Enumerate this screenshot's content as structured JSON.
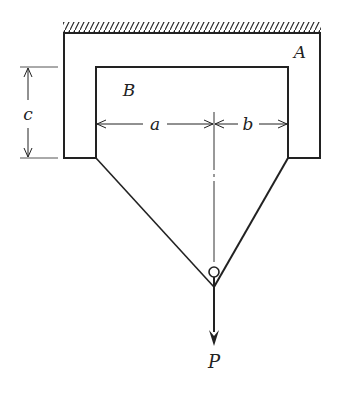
{
  "diagram": {
    "labels": {
      "body_a": "A",
      "body_b": "B",
      "dim_a": "a",
      "dim_b": "b",
      "dim_c": "c",
      "load": "P"
    },
    "colors": {
      "stroke": "#222222",
      "background": "#ffffff"
    }
  }
}
